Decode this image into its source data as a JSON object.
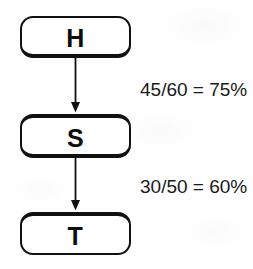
{
  "diagram": {
    "type": "flowchart",
    "background_color": "#fefefe",
    "stroke_color": "#111111",
    "text_color": "#1a1a1a",
    "nodes": [
      {
        "id": "h",
        "label": "H",
        "shape": "rounded-rectangle"
      },
      {
        "id": "s",
        "label": "S",
        "shape": "rounded-rectangle"
      },
      {
        "id": "t",
        "label": "T",
        "shape": "rounded-rectangle"
      }
    ],
    "edges": [
      {
        "id": "h-to-s",
        "from": "H",
        "to": "S",
        "arrow": "down",
        "label": "45/60 = 75%",
        "numerator": 45,
        "denominator": 60,
        "percent": "75%"
      },
      {
        "id": "s-to-t",
        "from": "S",
        "to": "T",
        "arrow": "down",
        "label": "30/50 = 60%",
        "numerator": 30,
        "denominator": 50,
        "percent": "60%"
      }
    ]
  }
}
